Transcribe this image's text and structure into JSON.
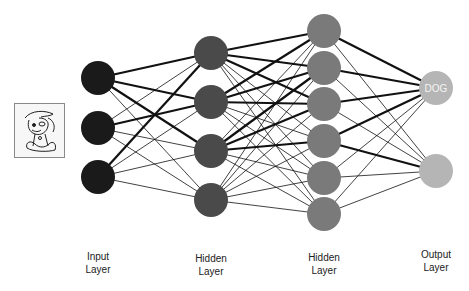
{
  "diagram": {
    "title": "",
    "input_image": {
      "icon": "cartoon-dog-icon",
      "alt": "dog"
    },
    "layers": [
      {
        "name": "Input",
        "label_line1": "Input",
        "label_line2": "Layer",
        "color": "#1a1a1a",
        "nodes": [
          {
            "x": 98,
            "y": 78
          },
          {
            "x": 98,
            "y": 128
          },
          {
            "x": 98,
            "y": 177
          }
        ]
      },
      {
        "name": "Hidden1",
        "label_line1": "Hidden",
        "label_line2": "Layer",
        "color": "#4a4a4a",
        "nodes": [
          {
            "x": 211,
            "y": 53
          },
          {
            "x": 211,
            "y": 102
          },
          {
            "x": 211,
            "y": 151
          },
          {
            "x": 211,
            "y": 200
          }
        ]
      },
      {
        "name": "Hidden2",
        "label_line1": "Hidden",
        "label_line2": "Layer",
        "color": "#7a7a7a",
        "nodes": [
          {
            "x": 324,
            "y": 31
          },
          {
            "x": 324,
            "y": 68
          },
          {
            "x": 324,
            "y": 104
          },
          {
            "x": 324,
            "y": 141
          },
          {
            "x": 324,
            "y": 178
          },
          {
            "x": 324,
            "y": 214
          }
        ]
      },
      {
        "name": "Output",
        "label_line1": "Output",
        "label_line2": "Layer",
        "color": "#b5b5b5",
        "nodes": [
          {
            "x": 436,
            "y": 88,
            "text": "DOG"
          },
          {
            "x": 436,
            "y": 171,
            "text": ""
          }
        ]
      }
    ],
    "node_radius": 17,
    "thick_edges": [
      [
        0,
        0,
        1,
        0
      ],
      [
        0,
        0,
        1,
        1
      ],
      [
        0,
        0,
        1,
        2
      ],
      [
        0,
        1,
        1,
        1
      ],
      [
        0,
        2,
        1,
        0
      ],
      [
        1,
        0,
        2,
        0
      ],
      [
        1,
        0,
        2,
        1
      ],
      [
        1,
        0,
        2,
        2
      ],
      [
        1,
        1,
        2,
        0
      ],
      [
        1,
        1,
        2,
        1
      ],
      [
        1,
        1,
        2,
        2
      ],
      [
        1,
        2,
        2,
        1
      ],
      [
        1,
        2,
        2,
        2
      ],
      [
        1,
        2,
        2,
        3
      ],
      [
        2,
        0,
        3,
        0
      ],
      [
        2,
        1,
        3,
        0
      ],
      [
        2,
        2,
        3,
        0
      ],
      [
        2,
        3,
        3,
        0
      ],
      [
        2,
        3,
        3,
        1
      ]
    ],
    "edge_color": "#111111",
    "thin_width": 0.8,
    "thick_width": 2.2,
    "output_text_color": "#f4f4f4"
  },
  "labels": {
    "input": {
      "line1": "Input",
      "line2": "Layer"
    },
    "hidden1": {
      "line1": "Hidden",
      "line2": "Layer"
    },
    "hidden2": {
      "line1": "Hidden",
      "line2": "Layer"
    },
    "output": {
      "line1": "Output",
      "line2": "Layer"
    }
  }
}
